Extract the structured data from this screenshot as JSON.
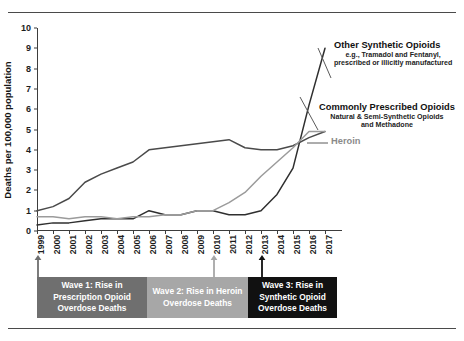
{
  "chart_data": {
    "type": "line",
    "title": "",
    "xlabel": "",
    "ylabel": "Deaths per 100,000 population",
    "ylim": [
      0,
      10
    ],
    "yticks": [
      0,
      1,
      2,
      3,
      4,
      5,
      6,
      7,
      8,
      9,
      10
    ],
    "grid": false,
    "legend_position": "right-inline-annotations",
    "categories": [
      "1999",
      "2000",
      "2001",
      "2002",
      "2003",
      "2004",
      "2005",
      "2006",
      "2007",
      "2008",
      "2009",
      "2010",
      "2011",
      "2012",
      "2013",
      "2014",
      "2015",
      "2016",
      "2017"
    ],
    "series": [
      {
        "name": "Other Synthetic Opioids",
        "color": "#2f2f2f",
        "values": [
          0.3,
          0.4,
          0.4,
          0.5,
          0.6,
          0.6,
          0.6,
          1.0,
          0.8,
          0.8,
          1.0,
          1.0,
          0.8,
          0.8,
          1.0,
          1.8,
          3.1,
          6.2,
          9.0
        ]
      },
      {
        "name": "Commonly Prescribed Opioids",
        "color": "#4a4a4a",
        "values": [
          1.0,
          1.2,
          1.6,
          2.4,
          2.8,
          3.1,
          3.4,
          4.0,
          4.1,
          4.2,
          4.3,
          4.4,
          4.5,
          4.1,
          4.0,
          4.0,
          4.2,
          4.6,
          4.9
        ]
      },
      {
        "name": "Heroin",
        "color": "#9b9b9b",
        "values": [
          0.7,
          0.7,
          0.6,
          0.7,
          0.7,
          0.6,
          0.7,
          0.7,
          0.8,
          0.8,
          1.0,
          1.0,
          1.4,
          1.9,
          2.7,
          3.4,
          4.1,
          4.9,
          4.9
        ]
      }
    ],
    "annotations": [
      {
        "id": "other-synthetic",
        "title": "Other Synthetic Opioids",
        "subtitle_line1": "e.g., Tramadol and Fentanyl,",
        "subtitle_line2": "prescribed or illicitly manufactured",
        "color": "#111111"
      },
      {
        "id": "commonly-prescribed",
        "title": "Commonly Prescribed Opioids",
        "subtitle_line1": "Natural & Semi-Synthetic Opioids",
        "subtitle_line2": "and Methadone",
        "color": "#111111"
      },
      {
        "id": "heroin",
        "title": "Heroin",
        "subtitle_line1": "",
        "subtitle_line2": "",
        "color": "#8a8a8a"
      }
    ],
    "waves": [
      {
        "id": "wave-1",
        "line1": "Wave 1: Rise in",
        "line2": "Prescription Opioid",
        "line3": "Overdose Deaths",
        "color": "#6f6f6f",
        "marker_year": "1999"
      },
      {
        "id": "wave-2",
        "line1": "Wave 2: Rise in Heroin",
        "line2": "Overdose Deaths",
        "line3": "",
        "color": "#a7a7a7",
        "marker_year": "2010"
      },
      {
        "id": "wave-3",
        "line1": "Wave 3: Rise in",
        "line2": "Synthetic Opioid",
        "line3": "Overdose Deaths",
        "color": "#111111",
        "marker_year": "2013"
      }
    ]
  }
}
